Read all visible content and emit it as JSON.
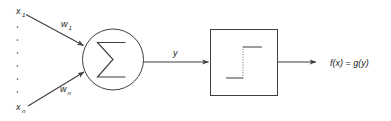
{
  "diagram": {
    "background_color": "#ffffff",
    "stroke_color": "#3f3f3f",
    "text_color": "#1a1a1a",
    "inputs": {
      "first": {
        "base": "x",
        "sub": "1"
      },
      "last": {
        "base": "x",
        "sub": "n"
      },
      "vertical_dots_count": 6
    },
    "weights": {
      "first": {
        "base": "w",
        "sub": "1"
      },
      "last": {
        "base": "w",
        "sub": "n"
      }
    },
    "summation": {
      "symbol": "Σ",
      "shape": "circle"
    },
    "intermediate_signal": {
      "label": "y"
    },
    "activation": {
      "shape": "square",
      "function": "step",
      "riser_style": "dotted"
    },
    "output": {
      "label": "f(x) = g(y)"
    }
  }
}
